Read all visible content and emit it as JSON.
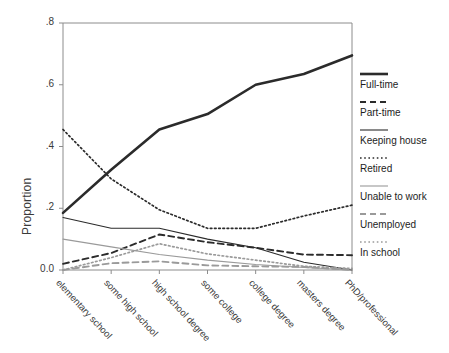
{
  "chart_data": {
    "type": "line",
    "title": "",
    "xlabel": "",
    "ylabel": "Proportion",
    "grid": false,
    "legend_position": "right",
    "ylim": [
      0.0,
      0.8
    ],
    "ytick_labels": [
      "0.0",
      ".2",
      ".4",
      ".6",
      ".8"
    ],
    "ytick_values": [
      0.0,
      0.2,
      0.4,
      0.6,
      0.8
    ],
    "categories": [
      "elementary school",
      "some high school",
      "high school degree",
      "some college",
      "college degree",
      "masters degree",
      "PhD/professional"
    ],
    "series": [
      {
        "name": "Full-time",
        "style": "solid-thick",
        "color": "#2b2b2b",
        "values": [
          0.185,
          0.325,
          0.455,
          0.505,
          0.6,
          0.635,
          0.695
        ]
      },
      {
        "name": "Part-time",
        "style": "dashed",
        "color": "#2b2b2b",
        "values": [
          0.02,
          0.055,
          0.115,
          0.09,
          0.072,
          0.05,
          0.048
        ]
      },
      {
        "name": "Keeping house",
        "style": "solid-thin",
        "color": "#2b2b2b",
        "values": [
          0.17,
          0.135,
          0.135,
          0.1,
          0.072,
          0.025,
          0.0
        ]
      },
      {
        "name": "Retired",
        "style": "dotted",
        "color": "#2b2b2b",
        "values": [
          0.455,
          0.295,
          0.195,
          0.135,
          0.135,
          0.175,
          0.21
        ]
      },
      {
        "name": "Unable to work",
        "style": "solid-thin",
        "color": "#9a9a9a",
        "values": [
          0.1,
          0.075,
          0.05,
          0.032,
          0.018,
          0.008,
          0.0
        ]
      },
      {
        "name": "Unemployed",
        "style": "dashed",
        "color": "#9a9a9a",
        "values": [
          0.0,
          0.022,
          0.028,
          0.015,
          0.012,
          0.01,
          0.0
        ]
      },
      {
        "name": "In school",
        "style": "dotted",
        "color": "#9a9a9a",
        "values": [
          0.0,
          0.04,
          0.085,
          0.052,
          0.032,
          0.012,
          0.005
        ]
      }
    ]
  },
  "legend": {
    "items": [
      {
        "label": "Full-time"
      },
      {
        "label": "Part-time"
      },
      {
        "label": "Keeping house"
      },
      {
        "label": "Retired"
      },
      {
        "label": "Unable to work"
      },
      {
        "label": "Unemployed"
      },
      {
        "label": "In school"
      }
    ]
  },
  "axes": {
    "y_label": "Proportion"
  }
}
